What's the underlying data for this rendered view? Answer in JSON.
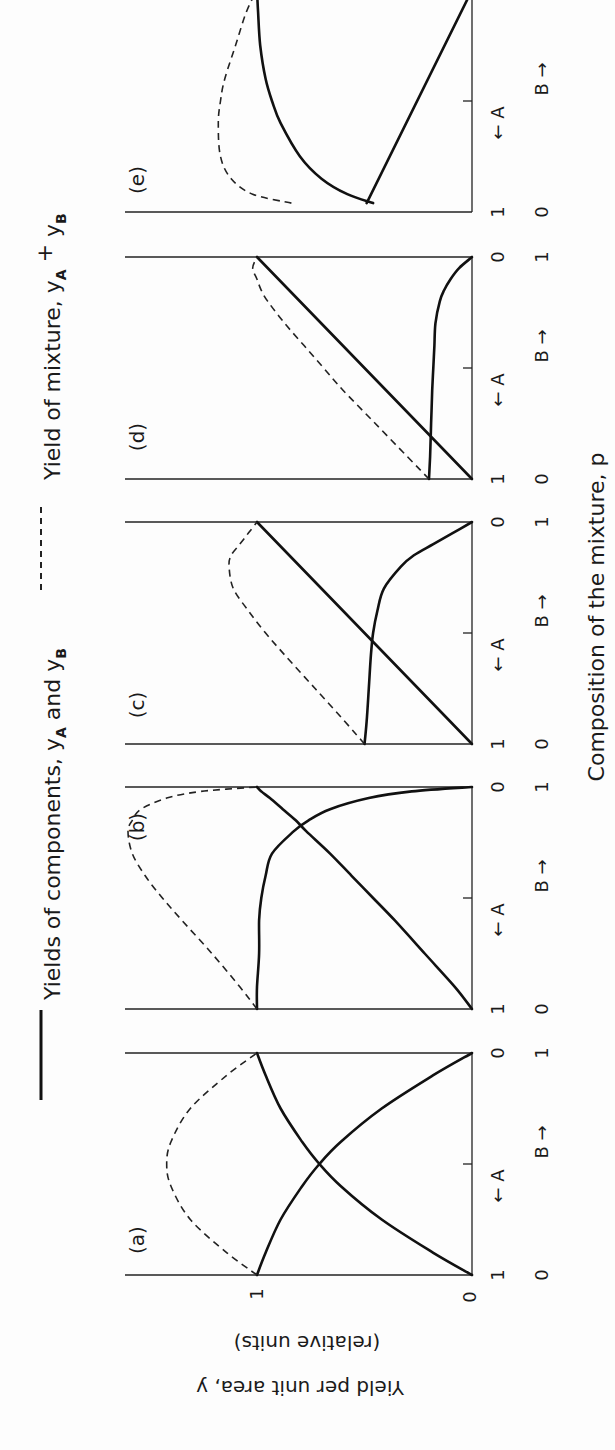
{
  "legend": {
    "solid_label": "Yields of components, ",
    "solid_var1": "y",
    "solid_sub1": "A",
    "solid_and": " and ",
    "solid_var2": "y",
    "solid_sub2": "B",
    "dashed_label": "Yield of mixture, ",
    "dashed_var1": "y",
    "dashed_sub1": "A",
    "dashed_plus": " + ",
    "dashed_var2": "y",
    "dashed_sub2": "B"
  },
  "x_axis_title": "Composition of the mixture, p",
  "y_axis": {
    "title_line1": "Yield per unit area, y",
    "title_line2": "(relative units)",
    "tick_0": "0",
    "tick_1": "1"
  },
  "direction_labels": {
    "a_arrow": "← A",
    "b_arrow": "B →"
  },
  "chart_data": [
    {
      "type": "line",
      "panel": "(a)",
      "title": "(a)",
      "xlabel": "Composition of the mixture, p",
      "ylabel": "Yield per unit area, y (relative units)",
      "x_ticks_A": [
        "1",
        "0"
      ],
      "x_ticks_B": [
        "0",
        "1"
      ],
      "y_ticks": [
        "0",
        "1"
      ],
      "p": [
        0,
        0.1,
        0.25,
        0.4,
        0.5,
        0.6,
        0.75,
        0.9,
        1
      ],
      "series": [
        {
          "name": "yA",
          "style": "solid",
          "values": [
            0,
            0.18,
            0.42,
            0.61,
            0.71,
            0.79,
            0.89,
            0.96,
            1.0
          ]
        },
        {
          "name": "yB",
          "style": "solid",
          "values": [
            1.0,
            0.96,
            0.89,
            0.79,
            0.71,
            0.61,
            0.42,
            0.18,
            0
          ]
        },
        {
          "name": "yA + yB",
          "style": "dashed",
          "values": [
            1.0,
            1.14,
            1.31,
            1.4,
            1.42,
            1.4,
            1.31,
            1.14,
            1.0
          ]
        }
      ]
    },
    {
      "type": "line",
      "panel": "(b)",
      "title": "(b)",
      "x_ticks_A": [
        "1",
        "0"
      ],
      "x_ticks_B": [
        "0",
        "1"
      ],
      "p": [
        0,
        0.1,
        0.25,
        0.4,
        0.5,
        0.6,
        0.7,
        0.8,
        0.85,
        0.9,
        0.95,
        0.98,
        1
      ],
      "series": [
        {
          "name": "yA",
          "style": "solid",
          "values": [
            0,
            0.08,
            0.22,
            0.36,
            0.46,
            0.56,
            0.66,
            0.77,
            0.82,
            0.88,
            0.94,
            0.98,
            1.0
          ]
        },
        {
          "name": "yB",
          "style": "solid",
          "values": [
            1.0,
            1.0,
            0.99,
            0.99,
            0.98,
            0.96,
            0.93,
            0.83,
            0.76,
            0.66,
            0.48,
            0.28,
            0
          ]
        },
        {
          "name": "yA + yB",
          "style": "dashed",
          "values": [
            1.0,
            1.08,
            1.21,
            1.35,
            1.44,
            1.52,
            1.58,
            1.6,
            1.58,
            1.54,
            1.42,
            1.26,
            1.0
          ]
        }
      ]
    },
    {
      "type": "line",
      "panel": "(c)",
      "title": "(c)",
      "x_ticks_A": [
        "1",
        "0"
      ],
      "x_ticks_B": [
        "0",
        "1"
      ],
      "p": [
        0,
        0.1,
        0.25,
        0.4,
        0.5,
        0.6,
        0.7,
        0.8,
        0.85,
        0.9,
        0.95,
        1
      ],
      "series": [
        {
          "name": "yA",
          "style": "solid",
          "values": [
            0,
            0.1,
            0.25,
            0.4,
            0.5,
            0.6,
            0.7,
            0.8,
            0.85,
            0.9,
            0.95,
            1.0
          ]
        },
        {
          "name": "yB",
          "style": "solid",
          "values": [
            0.5,
            0.49,
            0.48,
            0.47,
            0.46,
            0.44,
            0.41,
            0.33,
            0.27,
            0.18,
            0.09,
            0
          ]
        },
        {
          "name": "yA + yB",
          "style": "dashed",
          "values": [
            0.5,
            0.59,
            0.73,
            0.87,
            0.96,
            1.04,
            1.11,
            1.13,
            1.12,
            1.08,
            1.04,
            1.0
          ]
        }
      ]
    },
    {
      "type": "line",
      "panel": "(d)",
      "title": "(d)",
      "x_ticks_A": [
        "1",
        "0"
      ],
      "x_ticks_B": [
        "0",
        "1"
      ],
      "p": [
        0,
        0.1,
        0.25,
        0.4,
        0.5,
        0.6,
        0.7,
        0.8,
        0.85,
        0.9,
        0.95,
        1
      ],
      "series": [
        {
          "name": "yA",
          "style": "solid",
          "values": [
            0,
            0.1,
            0.25,
            0.4,
            0.5,
            0.6,
            0.7,
            0.8,
            0.85,
            0.9,
            0.95,
            1.0
          ]
        },
        {
          "name": "yB",
          "style": "solid",
          "values": [
            0.2,
            0.195,
            0.19,
            0.185,
            0.18,
            0.175,
            0.17,
            0.15,
            0.13,
            0.1,
            0.06,
            0
          ]
        },
        {
          "name": "yA + yB",
          "style": "dashed",
          "values": [
            0.2,
            0.3,
            0.45,
            0.6,
            0.69,
            0.78,
            0.87,
            0.95,
            0.98,
            1.0,
            1.02,
            1.0
          ]
        }
      ]
    },
    {
      "type": "line",
      "panel": "(e)",
      "title": "(e)",
      "x_ticks_A": [
        "1",
        "0"
      ],
      "x_ticks_B": [
        "0",
        "1"
      ],
      "p": [
        0.04,
        0.08,
        0.15,
        0.25,
        0.4,
        0.5,
        0.6,
        0.75,
        0.9,
        1
      ],
      "series": [
        {
          "name": "yA",
          "style": "solid",
          "values": [
            0.46,
            0.58,
            0.7,
            0.8,
            0.89,
            0.93,
            0.96,
            0.985,
            0.995,
            1.0
          ]
        },
        {
          "name": "yB",
          "style": "solid",
          "values": [
            0.49,
            0.47,
            0.43,
            0.38,
            0.31,
            0.26,
            0.21,
            0.13,
            0.05,
            0
          ]
        },
        {
          "name": "yA + yB",
          "style": "dashed",
          "values": [
            0.84,
            1.02,
            1.12,
            1.17,
            1.18,
            1.17,
            1.15,
            1.1,
            1.05,
            1.0
          ]
        }
      ]
    }
  ]
}
